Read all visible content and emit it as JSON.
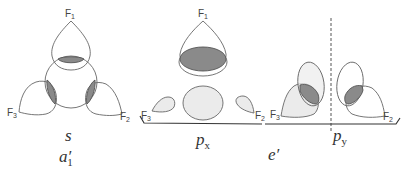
{
  "figure": {
    "panels": [
      {
        "id": "s",
        "orbital_label": "s",
        "symmetry_label_base": "a",
        "symmetry_label_prime": "′",
        "symmetry_label_sub": "1",
        "ligand_labels": {
          "top": "F",
          "top_sub": "1",
          "left": "F",
          "left_sub": "3",
          "right": "F",
          "right_sub": "2"
        }
      },
      {
        "id": "px",
        "orbital_label_base": "p",
        "orbital_label_sub": "x",
        "ligand_labels": {
          "top": "F",
          "top_sub": "1",
          "left": "F",
          "left_sub": "3",
          "right": "F",
          "right_sub": "2"
        }
      },
      {
        "id": "py",
        "orbital_label_base": "p",
        "orbital_label_sub": "y",
        "ligand_labels": {
          "left": "F",
          "left_sub": "3",
          "right": "F",
          "right_sub": "2"
        }
      }
    ],
    "shared_symmetry_label": "e′",
    "colors": {
      "outline": "#666666",
      "overlap_shade": "#8a8a8a",
      "light_lobe": "#ebebeb",
      "text": "#333333"
    }
  }
}
